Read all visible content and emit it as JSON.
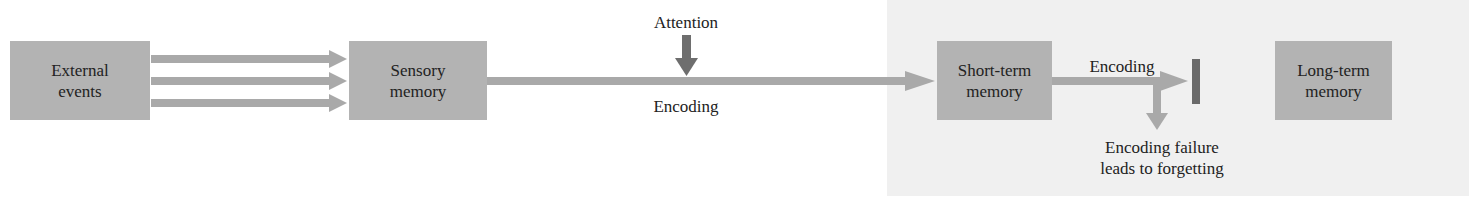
{
  "diagram": {
    "title": "",
    "nodes": {
      "external_events": {
        "line1": "External",
        "line2": "events"
      },
      "sensory_memory": {
        "line1": "Sensory",
        "line2": "memory"
      },
      "short_term_memory": {
        "line1": "Short-term",
        "line2": "memory"
      },
      "long_term_memory": {
        "line1": "Long-term",
        "line2": "memory"
      }
    },
    "labels": {
      "attention": "Attention",
      "encoding_main": "Encoding",
      "encoding_stm": "Encoding",
      "failure_line1": "Encoding failure",
      "failure_line2": "leads to forgetting"
    },
    "edges": [
      {
        "from": "external_events",
        "to": "sensory_memory",
        "count": 3
      },
      {
        "from": "sensory_memory",
        "to": "short_term_memory",
        "label": "Encoding"
      },
      {
        "from": "attention",
        "to": "sensory_memory->short_term_memory"
      },
      {
        "from": "short_term_memory",
        "to": "long_term_memory",
        "label": "Encoding",
        "blocked": true
      },
      {
        "from": "short_term_memory",
        "to": "forgetting",
        "label": "Encoding failure leads to forgetting"
      }
    ],
    "colors": {
      "box": "#b3b3b3",
      "arrow": "#a9a9a9",
      "attention_arrow": "#6e6e6e",
      "block_bar": "#6a6a6a",
      "panel": "#f0f0f0"
    }
  }
}
